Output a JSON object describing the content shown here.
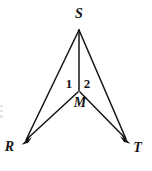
{
  "figure": {
    "kind": "geometry-diagram",
    "name": "two-triangles-sharing-segment-SM",
    "background_color": "#ffffff",
    "stroke_color": "#141414",
    "width": 152,
    "height": 171
  },
  "labels": {
    "S": "S",
    "M": "M",
    "R": "R",
    "T": "T",
    "angle_1": "1",
    "angle_2": "2"
  },
  "points": {
    "S": {
      "x": 79,
      "y": 28
    },
    "M": {
      "x": 79,
      "y": 92
    },
    "R": {
      "x": 22,
      "y": 144
    },
    "T": {
      "x": 130,
      "y": 143
    }
  },
  "segments": [
    {
      "name": "SR",
      "from": "S",
      "to": "R",
      "arrow_at_end": true
    },
    {
      "name": "ST",
      "from": "S",
      "to": "T",
      "arrow_at_end": true
    },
    {
      "name": "SM",
      "from": "S",
      "to": "M",
      "arrow_at_end": false
    },
    {
      "name": "MR",
      "from": "M",
      "to": "R",
      "arrow_at_end": true
    },
    {
      "name": "MT",
      "from": "M",
      "to": "T",
      "arrow_at_end": true
    }
  ]
}
